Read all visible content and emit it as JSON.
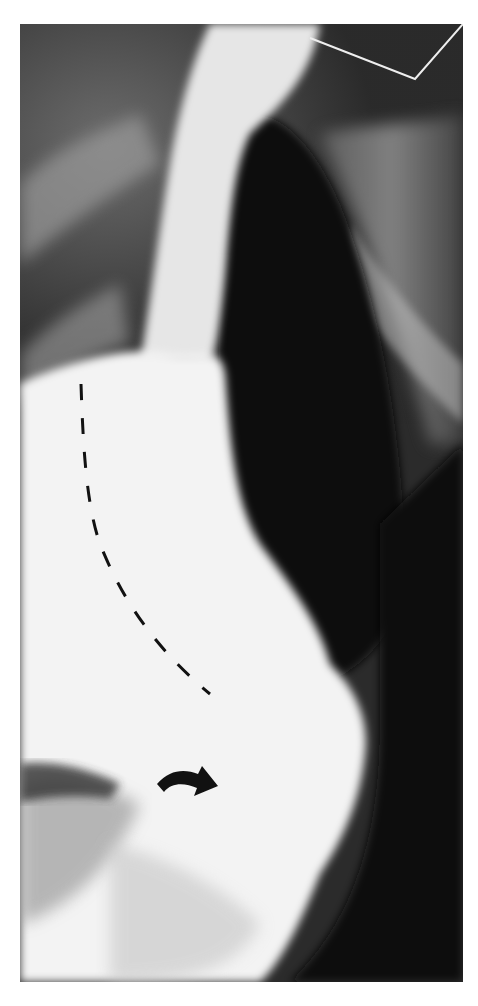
{
  "image": {
    "type": "barium contrast radiograph",
    "colors": {
      "background": "#ffffff",
      "dark": "#141414",
      "contrast": "#f4f4f4",
      "annotation": "#111111"
    },
    "annotations": [
      {
        "name": "dashed-curve",
        "description": "dashed line tracing contour of contrast-filled organ"
      },
      {
        "name": "curved-arrow",
        "description": "black curved arrow pointing down-right"
      }
    ]
  }
}
